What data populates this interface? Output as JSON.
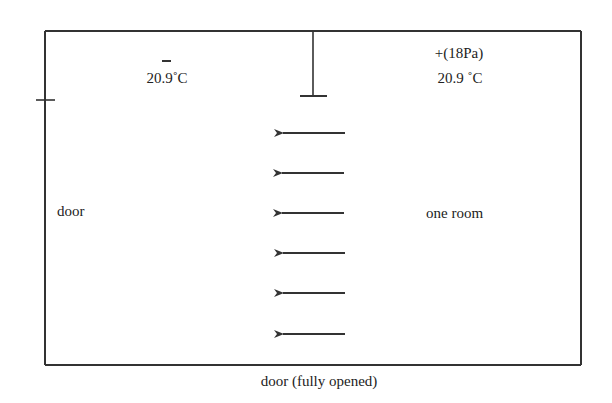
{
  "diagram": {
    "left_room": {
      "pressure_sign": "–",
      "temperature": "20.9˚C"
    },
    "right_room": {
      "pressure_label": "+(18Pa)",
      "temperature": "20.9 ˚C",
      "name": "one room"
    },
    "left_door_label": "door",
    "bottom_door_label": "door (fully opened)",
    "airflow": {
      "direction": "right-to-left",
      "arrow_count": 6,
      "arrow_y": [
        133,
        173,
        213,
        253,
        293,
        334
      ]
    },
    "colors": {
      "line": "#333333",
      "text": "#222222",
      "background": "#ffffff"
    }
  }
}
